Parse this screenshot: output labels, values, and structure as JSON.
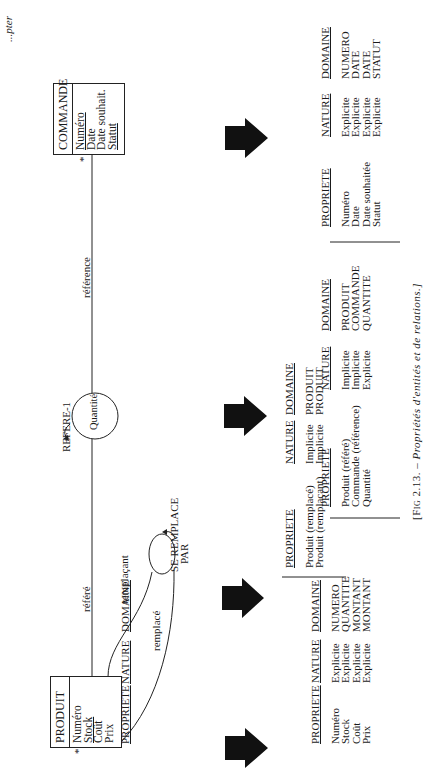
{
  "page_header": "...pter",
  "diagram": {
    "entities": [
      {
        "name": "PRODUIT",
        "attributes": [
          {
            "label": "Numéro",
            "underline": false
          },
          {
            "label": "Stock",
            "underline": true
          },
          {
            "label": "Coût",
            "underline": false
          },
          {
            "label": "Prix",
            "underline": false
          }
        ],
        "marker": "*"
      },
      {
        "name": "COMMANDE",
        "attributes": [
          {
            "label": "Numéro",
            "underline": true
          },
          {
            "label": "Date",
            "underline": false
          },
          {
            "label": "Date souhait.",
            "underline": false
          },
          {
            "label": "Statut",
            "underline": true
          }
        ],
        "marker": "*"
      }
    ],
    "relations": [
      {
        "name": "REFERE-1",
        "attribute": "Quantité",
        "roles": [
          "référé",
          "référence"
        ]
      },
      {
        "name": "SE REMPLACE PAR",
        "name_line1": "SE REMPLACE",
        "name_line2": "PAR",
        "roles": [
          "remplacé",
          "remplaçant"
        ]
      }
    ]
  },
  "tables": [
    {
      "id": "produit",
      "headers": [
        "PROPRIETE",
        "NATURE",
        "DOMAINE"
      ],
      "rows": [
        [
          "Numéro",
          "Explicite",
          "NUMERO"
        ],
        [
          "Stock",
          "Explicite",
          "QUANTITE"
        ],
        [
          "Coût",
          "Explicite",
          "MONTANT"
        ],
        [
          "Prix",
          "Explicite",
          "MONTANT"
        ]
      ]
    },
    {
      "id": "se-remplace-par",
      "headers": [
        "PROPRIETE",
        "NATURE",
        "DOMAINE"
      ],
      "rows": [
        [
          "Produit (remplacé)",
          "Implicite",
          "PRODUIT"
        ],
        [
          "Produit (remplaçant)",
          "Implicite",
          "PRODUIT"
        ]
      ]
    },
    {
      "id": "refere-1",
      "headers": [
        "PROPRIETE",
        "NATURE",
        "DOMAINE"
      ],
      "rows": [
        [
          "Produit (référé)",
          "Implicite",
          "PRODUIT"
        ],
        [
          "Commande (référence)",
          "Implicite",
          "COMMANDE"
        ],
        [
          "Quantité",
          "Explicite",
          "QUANTITE"
        ]
      ]
    },
    {
      "id": "commande",
      "headers": [
        "PROPRIETE",
        "NATURE",
        "DOMAINE"
      ],
      "rows": [
        [
          "Numéro",
          "Explicite",
          "NUMERO"
        ],
        [
          "Date",
          "Explicite",
          "DATE"
        ],
        [
          "Date souhaitée",
          "Explicite",
          "DATE"
        ],
        [
          "Statut",
          "Explicite",
          "STATUT"
        ]
      ]
    }
  ],
  "caption": {
    "prefix": "[Fig 2.13. –",
    "text": "Propriétés d'entités et de relations.]"
  },
  "colors": {
    "ink": "#1a1a1a",
    "paper": "#ffffff"
  }
}
